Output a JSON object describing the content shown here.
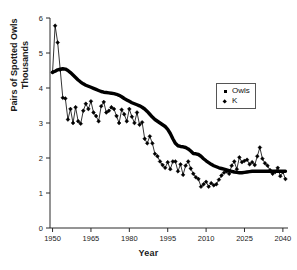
{
  "chart_data": {
    "type": "line",
    "title": "",
    "xlabel": "Year",
    "ylabel": "Pairs of Spotted Owls",
    "ylabel_line2": "Thousands",
    "xlim": [
      1949,
      2042
    ],
    "ylim": [
      0,
      6
    ],
    "xticks": [
      1950,
      1965,
      1980,
      1995,
      2010,
      2025,
      2040
    ],
    "yticks": [
      0,
      1,
      2,
      3,
      4,
      5,
      6
    ],
    "grid": false,
    "legend_position": "upper right",
    "series": [
      {
        "name": "Owls",
        "marker": "square",
        "style": "thick-line-no-marker",
        "x": [
          1950,
          1951,
          1952,
          1953,
          1954,
          1955,
          1956,
          1957,
          1958,
          1959,
          1960,
          1961,
          1962,
          1963,
          1964,
          1965,
          1966,
          1967,
          1968,
          1969,
          1970,
          1971,
          1972,
          1973,
          1974,
          1975,
          1976,
          1977,
          1978,
          1979,
          1980,
          1981,
          1982,
          1983,
          1984,
          1985,
          1986,
          1987,
          1988,
          1989,
          1990,
          1991,
          1992,
          1993,
          1994,
          1995,
          1996,
          1997,
          1998,
          1999,
          2000,
          2001,
          2002,
          2003,
          2004,
          2005,
          2006,
          2007,
          2008,
          2009,
          2010,
          2011,
          2012,
          2013,
          2014,
          2015,
          2016,
          2017,
          2018,
          2019,
          2020,
          2021,
          2022,
          2023,
          2024,
          2025,
          2026,
          2027,
          2028,
          2029,
          2030,
          2031,
          2032,
          2033,
          2034,
          2035,
          2036,
          2037,
          2038,
          2039,
          2040,
          2041
        ],
        "y": [
          4.45,
          4.48,
          4.52,
          4.54,
          4.55,
          4.54,
          4.5,
          4.44,
          4.37,
          4.3,
          4.23,
          4.17,
          4.12,
          4.08,
          4.05,
          4.02,
          3.99,
          3.96,
          3.93,
          3.9,
          3.88,
          3.87,
          3.86,
          3.85,
          3.84,
          3.82,
          3.79,
          3.75,
          3.7,
          3.66,
          3.62,
          3.58,
          3.55,
          3.52,
          3.49,
          3.45,
          3.4,
          3.33,
          3.25,
          3.17,
          3.1,
          3.05,
          3.0,
          2.95,
          2.9,
          2.82,
          2.7,
          2.55,
          2.42,
          2.35,
          2.33,
          2.32,
          2.3,
          2.26,
          2.2,
          2.13,
          2.12,
          2.1,
          2.05,
          1.98,
          1.92,
          1.87,
          1.82,
          1.78,
          1.75,
          1.72,
          1.7,
          1.68,
          1.66,
          1.64,
          1.62,
          1.6,
          1.59,
          1.58,
          1.58,
          1.59,
          1.6,
          1.61,
          1.62,
          1.62,
          1.62,
          1.62,
          1.62,
          1.62,
          1.62,
          1.62,
          1.62,
          1.62,
          1.62,
          1.62,
          1.62,
          1.62
        ]
      },
      {
        "name": "K",
        "marker": "diamond",
        "style": "thin-line-with-markers",
        "x": [
          1950,
          1951,
          1952,
          1953,
          1954,
          1955,
          1956,
          1957,
          1958,
          1959,
          1960,
          1961,
          1962,
          1963,
          1964,
          1965,
          1966,
          1967,
          1968,
          1969,
          1970,
          1971,
          1972,
          1973,
          1974,
          1975,
          1976,
          1977,
          1978,
          1979,
          1980,
          1981,
          1982,
          1983,
          1984,
          1985,
          1986,
          1987,
          1988,
          1989,
          1990,
          1991,
          1992,
          1993,
          1994,
          1995,
          1996,
          1997,
          1998,
          1999,
          2000,
          2001,
          2002,
          2003,
          2004,
          2005,
          2006,
          2007,
          2008,
          2009,
          2010,
          2011,
          2012,
          2013,
          2014,
          2015,
          2016,
          2017,
          2018,
          2019,
          2020,
          2021,
          2022,
          2023,
          2024,
          2025,
          2026,
          2027,
          2028,
          2029,
          2030,
          2031,
          2032,
          2033,
          2034,
          2035,
          2036,
          2037,
          2038,
          2039,
          2040,
          2041
        ],
        "y": [
          4.45,
          5.78,
          5.3,
          4.52,
          3.72,
          3.7,
          3.1,
          3.4,
          3.0,
          3.45,
          3.05,
          2.98,
          3.35,
          3.55,
          3.4,
          3.62,
          3.3,
          3.2,
          3.05,
          3.48,
          3.6,
          3.3,
          3.35,
          3.45,
          3.4,
          3.2,
          3.0,
          3.38,
          3.25,
          3.05,
          3.4,
          3.18,
          3.0,
          3.3,
          2.95,
          3.02,
          2.55,
          2.42,
          2.62,
          2.42,
          2.12,
          2.05,
          1.9,
          1.8,
          1.72,
          1.88,
          1.68,
          1.9,
          1.9,
          1.62,
          1.82,
          1.52,
          1.78,
          1.9,
          1.7,
          1.55,
          1.45,
          1.4,
          1.18,
          1.25,
          1.32,
          1.18,
          1.28,
          1.22,
          1.25,
          1.38,
          1.5,
          1.58,
          1.62,
          1.55,
          1.78,
          1.9,
          1.68,
          2.02,
          1.88,
          1.92,
          1.95,
          1.82,
          1.88,
          1.8,
          2.05,
          2.3,
          1.98,
          1.85,
          1.78,
          1.65,
          1.55,
          1.6,
          1.72,
          1.48,
          1.6,
          1.4
        ]
      }
    ]
  },
  "legend": {
    "items": [
      {
        "label": "Owls",
        "marker": "square"
      },
      {
        "label": "K",
        "marker": "diamond"
      }
    ]
  }
}
